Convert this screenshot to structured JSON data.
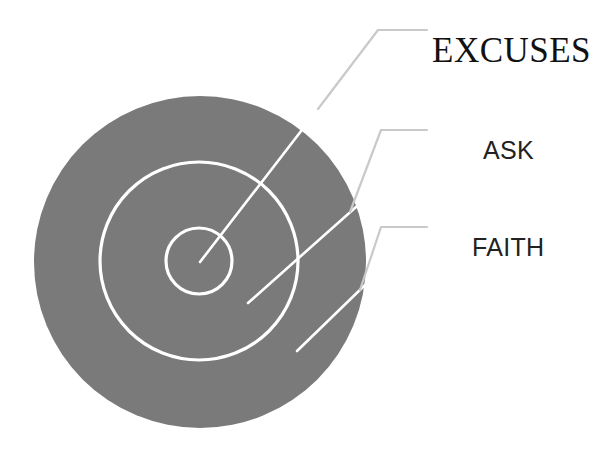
{
  "page": {
    "background_color": "#ffffff",
    "width": 615,
    "height": 450
  },
  "diagram": {
    "type": "concentric-target",
    "fill_color": "#7a7a7a",
    "ring_stroke_color": "#ffffff",
    "leader_line_color": "#c9c9c9",
    "center": {
      "x": 200,
      "y": 262
    },
    "rings": [
      {
        "name": "outer-disc",
        "label_ref": "FAITH",
        "radius": 166,
        "style": "filled"
      },
      {
        "name": "middle-ring",
        "label_ref": "ASK",
        "radius": 99,
        "style": "outline"
      },
      {
        "name": "inner-ring",
        "label_ref": "EXCUSES",
        "radius": 33,
        "style": "outline"
      }
    ]
  },
  "labels": [
    {
      "id": "excuses",
      "text": "EXCUSES",
      "font_style": "serif",
      "target_ring": "inner-ring",
      "leader": {
        "tip_x": 200,
        "tip_y": 262,
        "elbow_x": 378,
        "elbow_y": 30,
        "end_x": 427,
        "end_y": 30
      }
    },
    {
      "id": "ask",
      "text": "ASK",
      "font_style": "sans-serif",
      "target_ring": "middle-ring",
      "leader": {
        "tip_x": 248,
        "tip_y": 303,
        "elbow_x": 381,
        "elbow_y": 130,
        "end_x": 427,
        "end_y": 130
      }
    },
    {
      "id": "faith",
      "text": "FAITH",
      "font_style": "sans-serif",
      "target_ring": "outer-disc",
      "leader": {
        "tip_x": 297,
        "tip_y": 351,
        "elbow_x": 381,
        "elbow_y": 227,
        "end_x": 427,
        "end_y": 227
      }
    }
  ]
}
